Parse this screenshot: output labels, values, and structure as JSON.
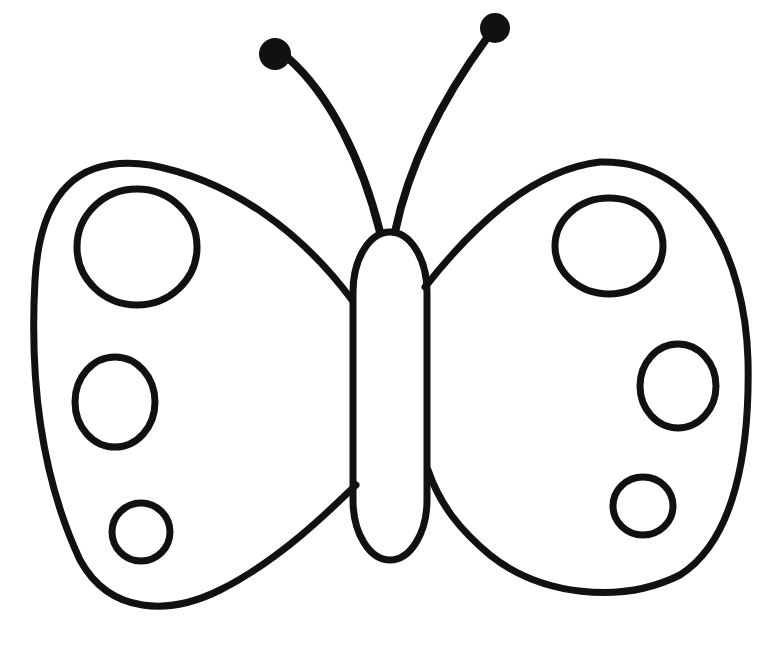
{
  "image": {
    "subject": "butterfly coloring page line drawing",
    "background": "#ffffff",
    "ink_color": "#111111"
  },
  "parts": {
    "antennae": 2,
    "body": 1,
    "wings": 2,
    "left_wing_spots": 3,
    "right_wing_spots": 3
  }
}
